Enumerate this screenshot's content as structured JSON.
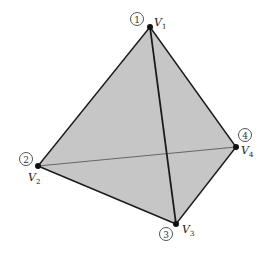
{
  "diagram": {
    "colors": {
      "face_fill": "#c6c6c6",
      "edge_front": "#1a1a1a",
      "edge_hidden": "#666666",
      "vertex_dot": "#111111"
    },
    "vertices": [
      {
        "id": "V1",
        "label": "V",
        "sub": "1",
        "number": "1",
        "x": 150,
        "y": 27
      },
      {
        "id": "V2",
        "label": "V",
        "sub": "2",
        "number": "2",
        "x": 38,
        "y": 166
      },
      {
        "id": "V3",
        "label": "V",
        "sub": "3",
        "number": "3",
        "x": 176,
        "y": 224
      },
      {
        "id": "V4",
        "label": "V",
        "sub": "4",
        "number": "4",
        "x": 236,
        "y": 147
      }
    ],
    "edges": [
      {
        "from": "V1",
        "to": "V2",
        "style": "outline"
      },
      {
        "from": "V1",
        "to": "V4",
        "style": "outline"
      },
      {
        "from": "V2",
        "to": "V3",
        "style": "outline"
      },
      {
        "from": "V3",
        "to": "V4",
        "style": "outline"
      },
      {
        "from": "V1",
        "to": "V3",
        "style": "front"
      },
      {
        "from": "V2",
        "to": "V4",
        "style": "hidden"
      }
    ]
  }
}
